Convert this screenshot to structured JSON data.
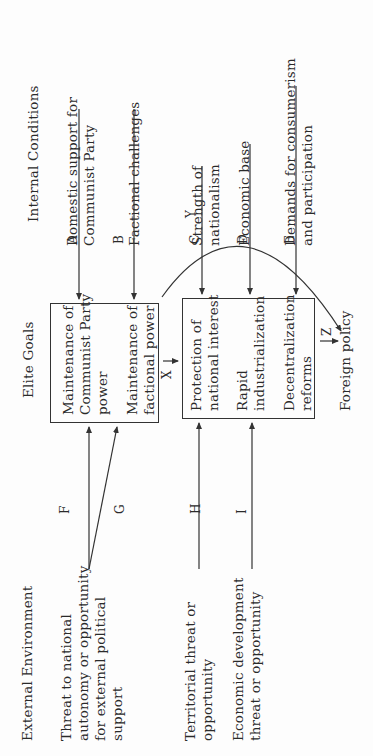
{
  "columns": {
    "internal": {
      "title": "Internal Conditions",
      "items": [
        {
          "text": "Domestic support for Communist Party",
          "lines": [
            "Domestic support for",
            "Communist Party"
          ],
          "arrow": "A",
          "target": "Maintenance of Communist Party power"
        },
        {
          "text": "Factional challenges",
          "lines": [
            "Factional challenges"
          ],
          "arrow": "B",
          "target": "Maintenance of factional power"
        },
        {
          "text": "Strength of nationalism",
          "lines": [
            "Strength of",
            "nationalism"
          ],
          "arrow": "C",
          "target": "Protection of national interest"
        },
        {
          "text": "Economic base",
          "lines": [
            "Economic base"
          ],
          "arrow": "D",
          "target": "Rapid industrialization"
        },
        {
          "text": "Demands for consumerism and participation",
          "lines": [
            "Demands for consumerism",
            "and participation"
          ],
          "arrow": "E",
          "target": "Decentralization reforms"
        }
      ]
    },
    "elite": {
      "title": "Elite Goals",
      "box1": [
        {
          "lines": [
            "Maintenance of",
            "Communist Party",
            "power"
          ]
        },
        {
          "lines": [
            "Maintenance of",
            "factional power"
          ]
        }
      ],
      "box2": [
        {
          "lines": [
            "Protection of",
            "national interest"
          ]
        },
        {
          "lines": [
            "Rapid",
            "industrialization"
          ]
        },
        {
          "lines": [
            "Decentralization",
            "reforms"
          ]
        }
      ],
      "output": "Foreign policy"
    },
    "external": {
      "title": "External Environment",
      "items": [
        {
          "lines": [
            "Threat to national",
            "autonomy or opportunity",
            "for external political",
            "support"
          ],
          "arrows": [
            "F",
            "G"
          ]
        },
        {
          "lines": [
            "Territorial threat or",
            "opportunity"
          ],
          "arrow": "H"
        },
        {
          "lines": [
            "Economic development",
            "threat or opportunity"
          ],
          "arrow": "I"
        }
      ]
    }
  },
  "arrow_labels": {
    "A": "A",
    "B": "B",
    "C": "C",
    "D": "D",
    "E": "E",
    "F": "F",
    "G": "G",
    "H": "H",
    "I": "I",
    "X": "X",
    "Y": "Y",
    "Z": "Z"
  }
}
